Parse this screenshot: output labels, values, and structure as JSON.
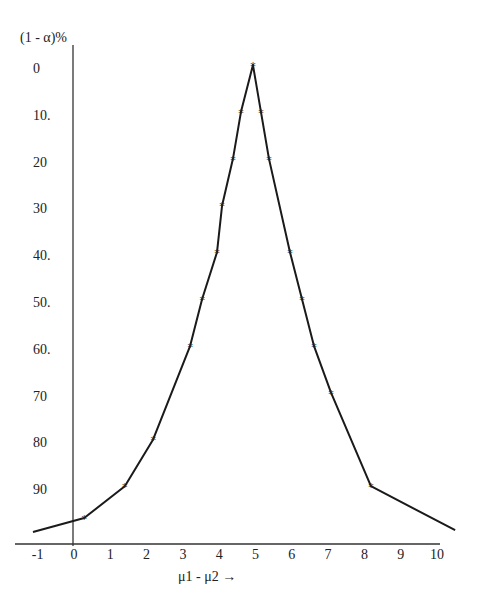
{
  "chart_data": {
    "type": "line",
    "title": "",
    "xlabel": "μ1 - μ2 →",
    "ylabel": "(1 - α)%",
    "x_ticks": [
      "-1",
      "0",
      "1",
      "2",
      "3",
      "4",
      "5",
      "6",
      "7",
      "8",
      "9",
      "10"
    ],
    "y_ticks": [
      "0",
      "10.",
      "20",
      "30",
      "40.",
      "50.",
      "60.",
      "70",
      "80",
      "90"
    ],
    "y_inverted": true,
    "xlim": [
      -1.2,
      10.5
    ],
    "ylim": [
      0,
      100
    ],
    "grid": false,
    "legend": null,
    "series": [
      {
        "name": "confidence curve",
        "marker": "*",
        "x": [
          -1.13,
          0.28,
          1.4,
          2.18,
          3.2,
          3.53,
          3.94,
          4.08,
          4.38,
          4.6,
          4.93,
          5.15,
          5.37,
          5.95,
          6.28,
          6.61,
          7.08,
          8.18,
          10.5
        ],
        "y": [
          99.8,
          96.8,
          90,
          80,
          60,
          50,
          40,
          30,
          20,
          10,
          0,
          10,
          20,
          40,
          50,
          60,
          70,
          90,
          99.4
        ]
      }
    ]
  },
  "labels": {
    "y_axis_title": "(1 - α)%",
    "x_axis_title": "μ1 - μ2 →"
  }
}
